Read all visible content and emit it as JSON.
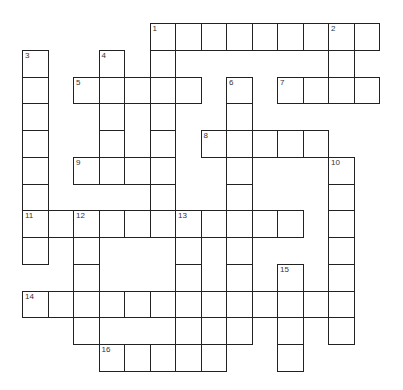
{
  "puzzle": {
    "origin": {
      "x": 22,
      "y": 23
    },
    "cell_w": 25.5,
    "cell_h": 26.75,
    "rows": [
      {
        "r": 0,
        "cols": [
          5,
          6,
          7,
          8,
          9,
          10,
          11,
          12,
          13
        ]
      },
      {
        "r": 1,
        "cols": [
          0,
          3,
          5,
          12
        ]
      },
      {
        "r": 2,
        "cols": [
          0,
          2,
          3,
          4,
          5,
          6,
          8,
          10,
          11,
          12,
          13
        ]
      },
      {
        "r": 3,
        "cols": [
          0,
          3,
          5,
          8
        ]
      },
      {
        "r": 4,
        "cols": [
          0,
          3,
          5,
          7,
          8,
          9,
          10,
          11
        ]
      },
      {
        "r": 5,
        "cols": [
          0,
          2,
          3,
          4,
          5,
          8,
          12
        ]
      },
      {
        "r": 6,
        "cols": [
          0,
          5,
          8,
          12
        ]
      },
      {
        "r": 7,
        "cols": [
          0,
          1,
          2,
          3,
          4,
          5,
          6,
          7,
          8,
          9,
          10,
          12
        ]
      },
      {
        "r": 8,
        "cols": [
          0,
          2,
          6,
          8,
          12
        ]
      },
      {
        "r": 9,
        "cols": [
          2,
          6,
          8,
          10,
          12
        ]
      },
      {
        "r": 10,
        "cols": [
          0,
          1,
          2,
          3,
          4,
          5,
          6,
          7,
          8,
          9,
          10,
          11,
          12
        ]
      },
      {
        "r": 11,
        "cols": [
          2,
          6,
          8,
          10,
          12
        ]
      },
      {
        "r": 12,
        "cols": [
          3,
          4,
          5,
          6,
          7,
          10
        ]
      }
    ],
    "numbers": [
      {
        "n": "1",
        "r": 0,
        "c": 5
      },
      {
        "n": "2",
        "r": 0,
        "c": 12
      },
      {
        "n": "3",
        "r": 1,
        "c": 0
      },
      {
        "n": "4",
        "r": 1,
        "c": 3
      },
      {
        "n": "5",
        "r": 2,
        "c": 2
      },
      {
        "n": "6",
        "r": 2,
        "c": 8
      },
      {
        "n": "7",
        "r": 2,
        "c": 10
      },
      {
        "n": "8",
        "r": 4,
        "c": 7
      },
      {
        "n": "9",
        "r": 5,
        "c": 2
      },
      {
        "n": "10",
        "r": 5,
        "c": 12
      },
      {
        "n": "11",
        "r": 7,
        "c": 0
      },
      {
        "n": "12",
        "r": 7,
        "c": 2
      },
      {
        "n": "13",
        "r": 7,
        "c": 6
      },
      {
        "n": "14",
        "r": 10,
        "c": 0
      },
      {
        "n": "15",
        "r": 9,
        "c": 10
      },
      {
        "n": "16",
        "r": 12,
        "c": 3
      }
    ],
    "colors": {
      "border": "#222222",
      "cell": "#ffffff",
      "number": "#333333"
    }
  }
}
